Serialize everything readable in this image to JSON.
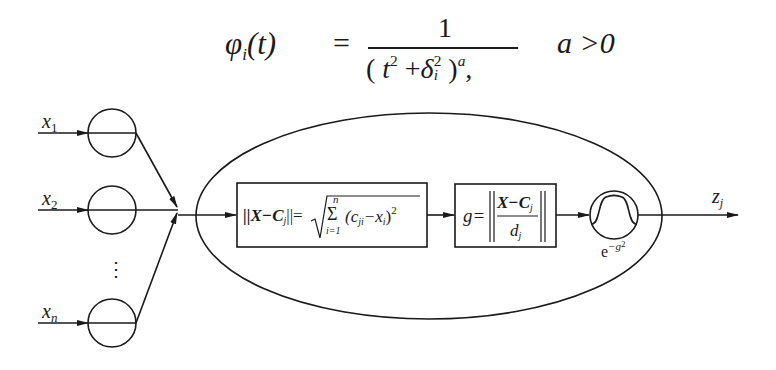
{
  "formula": {
    "lhs": "φ",
    "lhs_sub": "i",
    "lhs_arg": "(t)",
    "equals": "=",
    "numerator": "1",
    "denominator_open": "(",
    "denominator_t": "t",
    "denominator_t_exp": "2",
    "denominator_plus": "+",
    "denominator_delta": "δ",
    "denominator_delta_sub": "i",
    "denominator_delta_exp": "2",
    "denominator_close": ")",
    "denominator_exp": "a",
    "comma": ",",
    "condition": "a >0"
  },
  "diagram": {
    "inputs": [
      {
        "name": "x",
        "sub": "1"
      },
      {
        "name": "x",
        "sub": "2"
      },
      {
        "name": "x",
        "sub": "n"
      }
    ],
    "ellipsis": "⋮",
    "box1": {
      "lhs": "||X−C",
      "lhs_sub": "j",
      "lhs_close": "||=",
      "sum_top": "n",
      "sum_symbol": "Σ",
      "sum_bottom": "i=1",
      "term": "(c",
      "term_sub": "ji",
      "term_minus": "−x",
      "term_sub2": "i",
      "term_close": ")",
      "exp": "2"
    },
    "box2": {
      "lhs": "g=",
      "numerator": "X−C",
      "numerator_sub": "j",
      "denominator": "d",
      "denominator_sub": "j"
    },
    "gaussian": {
      "label_base": "e",
      "label_exp": "−g",
      "label_exp2": "2"
    },
    "output": {
      "name": "z",
      "sub": "j"
    }
  }
}
